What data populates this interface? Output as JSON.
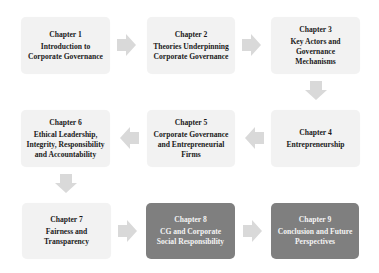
{
  "diagram": {
    "colors": {
      "light_box": "#f2f2f2",
      "dark_box": "#7f7f7f",
      "arrow": "#d9d9d9",
      "light_text": "#1a1a1a",
      "dark_text": "#f4f4f4"
    },
    "chapters": [
      {
        "label": "Chapter 1",
        "title_lines": [
          "Introduction to",
          "Corporate Governance"
        ],
        "style": "light"
      },
      {
        "label": "Chapter 2",
        "title_lines": [
          "Theories Underpinning",
          "Corporate Governance"
        ],
        "style": "light"
      },
      {
        "label": "Chapter 3",
        "title_lines": [
          "Key Actors and",
          "Governance",
          "Mechanisms"
        ],
        "style": "light"
      },
      {
        "label": "Chapter 4",
        "title_lines": [
          "Entrepreneurship"
        ],
        "style": "light"
      },
      {
        "label": "Chapter 5",
        "title_lines": [
          "Corporate Governance",
          "and Entrepreneurial",
          "Firms"
        ],
        "style": "light"
      },
      {
        "label": "Chapter 6",
        "title_lines": [
          "Ethical Leadership,",
          "Integrity, Responsibility",
          "and Accountability"
        ],
        "style": "light"
      },
      {
        "label": "Chapter 7",
        "title_lines": [
          "Fairness and",
          "Transparency"
        ],
        "style": "light"
      },
      {
        "label": "Chapter 8",
        "title_lines": [
          "CG and Corporate",
          "Social Responsibility"
        ],
        "style": "dark"
      },
      {
        "label": "Chapter 9",
        "title_lines": [
          "Conclusion and Future",
          "Perspectives"
        ],
        "style": "dark"
      }
    ],
    "arrows": [
      {
        "from": "Chapter 1",
        "to": "Chapter 2",
        "direction": "right"
      },
      {
        "from": "Chapter 2",
        "to": "Chapter 3",
        "direction": "right"
      },
      {
        "from": "Chapter 3",
        "to": "Chapter 4",
        "direction": "down"
      },
      {
        "from": "Chapter 4",
        "to": "Chapter 5",
        "direction": "left"
      },
      {
        "from": "Chapter 5",
        "to": "Chapter 6",
        "direction": "left"
      },
      {
        "from": "Chapter 6",
        "to": "Chapter 7",
        "direction": "down"
      },
      {
        "from": "Chapter 7",
        "to": "Chapter 8",
        "direction": "right"
      },
      {
        "from": "Chapter 8",
        "to": "Chapter 9",
        "direction": "right"
      }
    ]
  }
}
